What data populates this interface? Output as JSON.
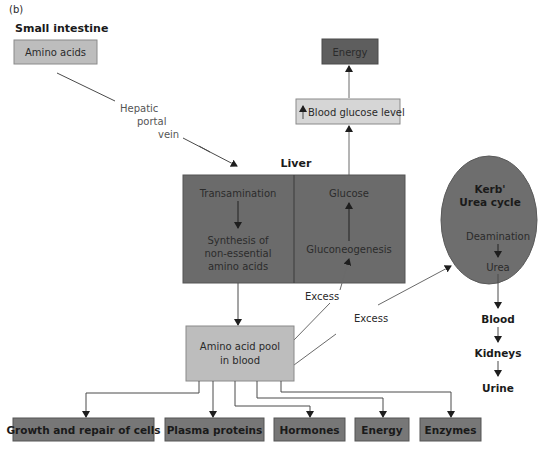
{
  "figure_label": "(b)",
  "colors": {
    "dark_box": "#6b6b6b",
    "light_box": "#bdbdbd",
    "pale_box": "#d9d9d9",
    "ellipse": "#6e6e6e",
    "outcome_box": "#777777"
  },
  "small_intestine": {
    "heading": "Small intestine",
    "box": "Amino acids"
  },
  "hepatic_portal_vein": {
    "line1": "Hepatic",
    "line2": "portal",
    "line3": "vein"
  },
  "energy_top": "Energy",
  "blood_glucose": {
    "arrow_glyph": "↑",
    "label": "Blood glucose level"
  },
  "liver": {
    "heading": "Liver",
    "left": {
      "top": "Transamination",
      "bottom_lines": [
        "Synthesis of",
        "non-essential",
        "amino acids"
      ]
    },
    "right": {
      "top": "Glucose",
      "bottom": "Gluconeogenesis"
    }
  },
  "urea_cycle": {
    "title_lines": [
      "Kerb'",
      "Urea cycle"
    ],
    "step1": "Deamination",
    "step2": "Urea"
  },
  "excretion_chain": [
    "Blood",
    "Kidneys",
    "Urine"
  ],
  "amino_pool": {
    "lines": [
      "Amino acid pool",
      "in blood"
    ]
  },
  "excess_labels": [
    "Excess",
    "Excess"
  ],
  "outcomes": [
    "Growth and repair of cells",
    "Plasma proteins",
    "Hormones",
    "Energy",
    "Enzymes"
  ]
}
